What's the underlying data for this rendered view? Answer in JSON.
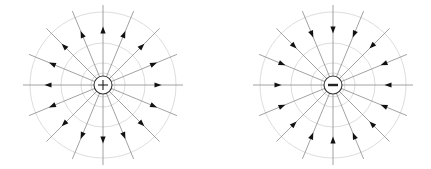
{
  "figure": {
    "background": "#ffffff",
    "colors": {
      "field_line": "#8a8a8a",
      "equipotential": "#d8d8d8",
      "arrow": "#111111",
      "charge_outline": "#333333",
      "charge_symbol": "#222222"
    },
    "line_count": 16,
    "line_length": 80,
    "arrow_radius": 55,
    "equipotential_radii": [
      12,
      22,
      42,
      73
    ],
    "charges": [
      {
        "name": "positive-charge",
        "sign": "+",
        "cx": 103,
        "cy": 85,
        "radius": 9,
        "field_direction": "outward"
      },
      {
        "name": "negative-charge",
        "sign": "−",
        "cx": 333,
        "cy": 85,
        "radius": 9,
        "field_direction": "inward"
      }
    ]
  }
}
